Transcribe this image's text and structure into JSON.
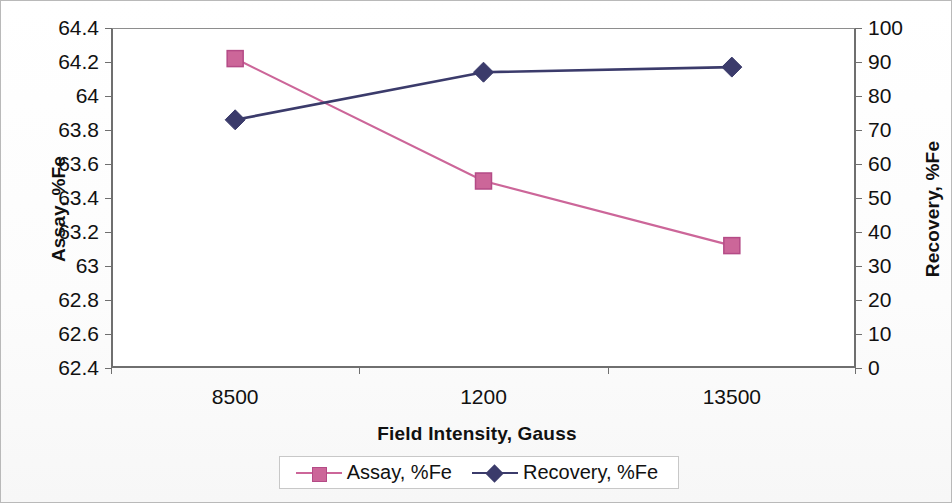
{
  "chart_data": {
    "type": "line",
    "title": "",
    "xlabel": "Field Intensity, Gauss",
    "categories": [
      "8500",
      "1200",
      "13500"
    ],
    "grid": false,
    "legend_position": "bottom",
    "axes": {
      "left": {
        "label": "Assay, %Fe",
        "ticks": [
          "64.4",
          "64.2",
          "64",
          "63.8",
          "63.6",
          "63.4",
          "63.2",
          "63",
          "62.8",
          "62.6",
          "62.4"
        ],
        "ylim": [
          62.4,
          64.4
        ],
        "step": 0.2
      },
      "right": {
        "label": "Recovery, %Fe",
        "ticks": [
          "100",
          "90",
          "80",
          "70",
          "60",
          "50",
          "40",
          "30",
          "20",
          "10",
          "0"
        ],
        "ylim": [
          0,
          100
        ],
        "step": 10
      }
    },
    "series": [
      {
        "name": "Assay, %Fe",
        "axis": "left",
        "marker": "square",
        "color": "#CC6699",
        "values": [
          64.22,
          63.5,
          63.12
        ]
      },
      {
        "name": "Recovery, %Fe",
        "axis": "right",
        "marker": "diamond",
        "color": "#3B3B6B",
        "values": [
          73,
          87,
          88.5
        ]
      }
    ]
  },
  "legend": {
    "entries": [
      {
        "label": "Assay, %Fe"
      },
      {
        "label": "Recovery, %Fe"
      }
    ]
  },
  "colors": {
    "assay": "#CC6699",
    "recovery": "#3B3B6B",
    "axis": "#6f6f6f",
    "text": "#111111"
  }
}
